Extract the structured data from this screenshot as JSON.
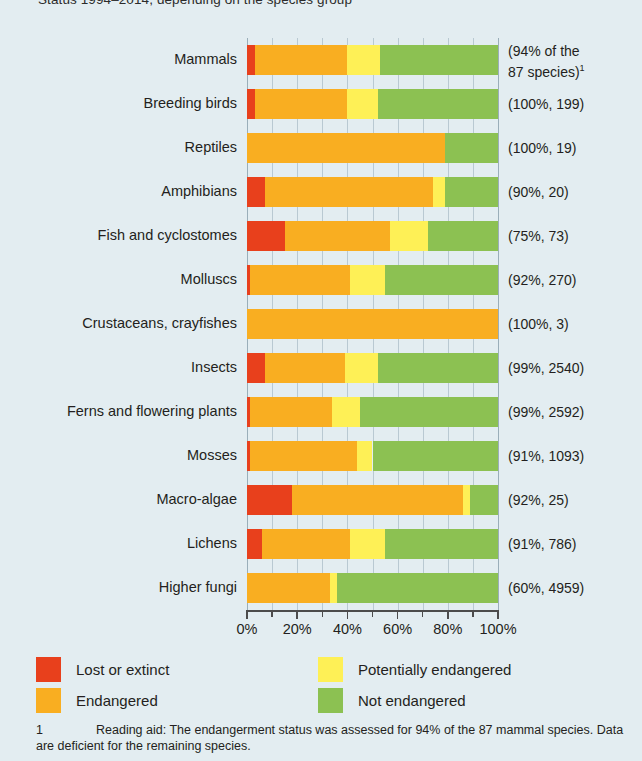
{
  "chart_data": {
    "type": "bar",
    "orientation": "horizontal",
    "stacked": true,
    "title": "Status 1994–2014, depending on the species group",
    "xlabel": "",
    "ylabel": "",
    "xlim": [
      0,
      100
    ],
    "xunit": "%",
    "grid": true,
    "legend_position": "bottom-left",
    "tick_labels": [
      "0%",
      "20%",
      "40%",
      "60%",
      "80%",
      "100%"
    ],
    "tick_values": [
      0,
      20,
      40,
      60,
      80,
      100
    ],
    "minor_tick_values": [
      10,
      30,
      50,
      70,
      90
    ],
    "categories": [
      "Mammals",
      "Breeding birds",
      "Reptiles",
      "Amphibians",
      "Fish and cyclostomes",
      "Molluscs",
      "Crustaceans, crayfishes",
      "Insects",
      "Ferns and flowering plants",
      "Mosses",
      "Macro-algae",
      "Lichens",
      "Higher fungi"
    ],
    "annotations": [
      "(94% of the\n87 species)¹",
      "(100%, 199)",
      "(100%, 19)",
      "(90%, 20)",
      "(75%, 73)",
      "(92%, 270)",
      "(100%, 3)",
      "(99%, 2540)",
      "(99%, 2592)",
      "(91%, 1093)",
      "(92%, 25)",
      "(91%, 786)",
      "(60%, 4959)"
    ],
    "series": [
      {
        "name": "Lost or extinct",
        "color": "#e8401c",
        "values": [
          3,
          3,
          0,
          7,
          15,
          1,
          0,
          7,
          1,
          1,
          18,
          6,
          0
        ]
      },
      {
        "name": "Endangered",
        "color": "#f9ae21",
        "values": [
          37,
          37,
          79,
          67,
          42,
          40,
          100,
          32,
          33,
          43,
          68,
          35,
          33
        ]
      },
      {
        "name": "Potentially endangered",
        "color": "#fef056",
        "values": [
          13,
          12,
          0,
          5,
          15,
          14,
          0,
          13,
          11,
          6,
          3,
          14,
          3
        ]
      },
      {
        "name": "Not endangered",
        "color": "#8cc152",
        "values": [
          47,
          48,
          21,
          21,
          28,
          45,
          0,
          48,
          55,
          50,
          11,
          45,
          64
        ]
      }
    ]
  },
  "legend": {
    "items": [
      {
        "label": "Lost or extinct",
        "color": "#e8401c"
      },
      {
        "label": "Endangered",
        "color": "#f9ae21"
      },
      {
        "label": "Potentially endangered",
        "color": "#fef056"
      },
      {
        "label": "Not endangered",
        "color": "#8cc152"
      }
    ]
  },
  "footnote": {
    "marker": "1",
    "text": "Reading aid: The endangerment status was assessed for 94% of the 87 mammal species. Data are deficient for the remaining species."
  },
  "colors": {
    "background": "#e3edf1",
    "grid": "#b9c9d2",
    "axis": "#4c4c4c",
    "text": "#231f20"
  }
}
